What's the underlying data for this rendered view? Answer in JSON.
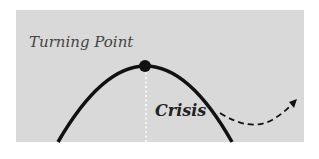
{
  "diagram": {
    "labels": {
      "turning_point": "Turning Point",
      "crisis": "Crisis"
    },
    "elements": {
      "curve": "inverted parabola (solid black)",
      "peak_marker": "filled black circle at curve apex",
      "vertical_guide": "white dotted line from apex down to baseline",
      "arrow": "dashed black curved arrow from Crisis point up and to the right"
    },
    "colors": {
      "background": "#ffffff",
      "panel": "#d9d9d9",
      "curve": "#111111",
      "guide": "#ffffff",
      "turning_point_text": "#444444",
      "crisis_text": "#222222"
    }
  }
}
